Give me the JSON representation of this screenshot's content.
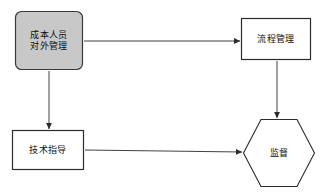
{
  "diagram": {
    "background_color": "#ffffff",
    "stroke_color": "#2b2b2b",
    "text_color": "#111111",
    "nodes": [
      {
        "id": "cost-staff-external-mgmt",
        "shape": "rounded-rectangle",
        "fill_color": "#c8c8c8",
        "border_color": "#3a3a3a",
        "lines": [
          "成本人员",
          "对外管理"
        ],
        "x": 15,
        "y": 11,
        "width": 68,
        "height": 59
      },
      {
        "id": "process-mgmt",
        "shape": "rectangle",
        "fill_color": "#ffffff",
        "border_color": "#2b2b2b",
        "lines": [
          "流程管理"
        ],
        "x": 241,
        "y": 18,
        "width": 70,
        "height": 42
      },
      {
        "id": "technical-guidance",
        "shape": "rectangle",
        "fill_color": "#ffffff",
        "border_color": "#2b2b2b",
        "lines": [
          "技术指导"
        ],
        "x": 12,
        "y": 130,
        "width": 72,
        "height": 40
      },
      {
        "id": "supervision",
        "shape": "hexagon",
        "fill_color": "#ffffff",
        "border_color": "#2b2b2b",
        "lines": [
          "监督"
        ],
        "x": 243,
        "y": 119,
        "width": 72,
        "height": 68
      }
    ],
    "edges": [
      {
        "id": "cost-staff-to-process-mgmt",
        "from": "cost-staff-external-mgmt",
        "to": "process-mgmt",
        "direction": "right",
        "label": ""
      },
      {
        "id": "cost-staff-to-technical-guidance",
        "from": "cost-staff-external-mgmt",
        "to": "technical-guidance",
        "direction": "down",
        "label": ""
      },
      {
        "id": "process-mgmt-to-supervision",
        "from": "process-mgmt",
        "to": "supervision",
        "direction": "down",
        "label": ""
      },
      {
        "id": "technical-guidance-to-supervision",
        "from": "technical-guidance",
        "to": "supervision",
        "direction": "right",
        "label": ""
      }
    ]
  }
}
